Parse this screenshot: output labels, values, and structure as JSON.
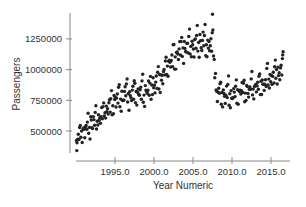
{
  "chart_data": {
    "type": "scatter",
    "title": "",
    "xlabel": "Year Numeric",
    "ylabel": "Passengers",
    "xlim": [
      1989.9,
      2017.3
    ],
    "ylim": [
      290000,
      1480000
    ],
    "x_ticks": [
      1995.0,
      2000.0,
      2005.0,
      2010.0,
      2015.0
    ],
    "x_tick_labels": [
      "1995.0",
      "2000.0",
      "2005.0",
      "2010.0",
      "2015.0"
    ],
    "y_ticks": [
      500000,
      750000,
      1000000,
      1250000
    ],
    "y_tick_labels": [
      "500000",
      "750000",
      "1000000",
      "1250000"
    ],
    "grid": false,
    "legend": null,
    "point_color": "#222222",
    "trend_anchors": [
      {
        "x": 1990.0,
        "y": 420000
      },
      {
        "x": 1991.0,
        "y": 500000
      },
      {
        "x": 1993.0,
        "y": 600000
      },
      {
        "x": 1995.0,
        "y": 740000
      },
      {
        "x": 1997.0,
        "y": 790000
      },
      {
        "x": 1999.0,
        "y": 810000
      },
      {
        "x": 2000.0,
        "y": 870000
      },
      {
        "x": 2001.0,
        "y": 940000
      },
      {
        "x": 2002.0,
        "y": 1040000
      },
      {
        "x": 2003.0,
        "y": 1130000
      },
      {
        "x": 2005.0,
        "y": 1170000
      },
      {
        "x": 2006.0,
        "y": 1210000
      },
      {
        "x": 2007.6,
        "y": 1190000
      },
      {
        "x": 2008.0,
        "y": 800000
      },
      {
        "x": 2010.0,
        "y": 790000
      },
      {
        "x": 2012.0,
        "y": 820000
      },
      {
        "x": 2014.0,
        "y": 870000
      },
      {
        "x": 2016.5,
        "y": 1000000
      }
    ],
    "notable_points": [
      {
        "x": 1990.1,
        "y": 340000,
        "note": "minimum"
      },
      {
        "x": 2007.5,
        "y": 1450000,
        "note": "maximum"
      },
      {
        "x": 2016.5,
        "y": 1120000,
        "note": "recent high"
      }
    ],
    "monthly_offsets": [
      0,
      -40000,
      30000,
      60000,
      -20000,
      90000,
      140000,
      -60000,
      20000,
      -90000,
      50000,
      10000
    ],
    "n_points_per_year": 12
  }
}
